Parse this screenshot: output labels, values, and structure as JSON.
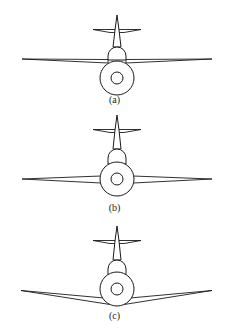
{
  "diagram": {
    "figures": [
      {
        "id": "a",
        "caption": "(a)",
        "wing_position": "high-wing"
      },
      {
        "id": "b",
        "caption": "(b)",
        "wing_position": "mid-wing"
      },
      {
        "id": "c",
        "caption": "(c)",
        "wing_position": "low-wing"
      }
    ],
    "colors": {
      "line": "#1a1a1a",
      "background": "#ffffff"
    }
  }
}
